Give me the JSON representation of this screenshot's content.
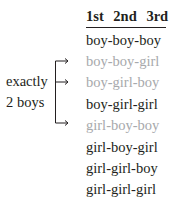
{
  "header": {
    "cols": [
      "1st",
      "2nd",
      "3rd"
    ]
  },
  "bracket_label": {
    "line1": "exactly",
    "line2": "2 boys"
  },
  "colors": {
    "text": "#231f20",
    "highlight": "#a7a9ac"
  },
  "outcomes": [
    {
      "text": "boy-boy-boy",
      "highlighted": false
    },
    {
      "text": "boy-boy-girl",
      "highlighted": true
    },
    {
      "text": "boy-girl-boy",
      "highlighted": true
    },
    {
      "text": "boy-girl-girl",
      "highlighted": false
    },
    {
      "text": "girl-boy-boy",
      "highlighted": true
    },
    {
      "text": "girl-boy-girl",
      "highlighted": false
    },
    {
      "text": "girl-girl-boy",
      "highlighted": false
    },
    {
      "text": "girl-girl-girl",
      "highlighted": false
    }
  ]
}
